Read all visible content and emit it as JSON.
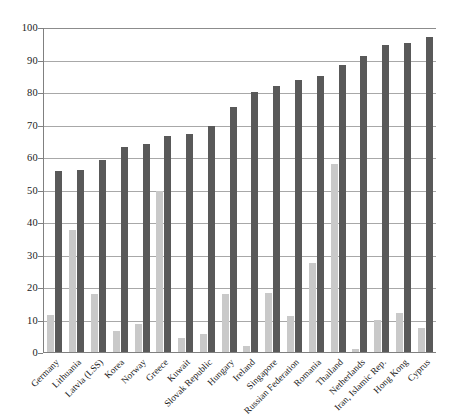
{
  "chart_data": {
    "type": "bar",
    "title": "",
    "subtitle": "",
    "xlabel": "",
    "ylabel": "",
    "ylim": [
      0,
      100
    ],
    "yticks": [
      0,
      10,
      20,
      30,
      40,
      50,
      60,
      70,
      80,
      90,
      100
    ],
    "grid": true,
    "legend_position": "none",
    "categories": [
      "Germany",
      "Lithuania",
      "Latvia (LSS)",
      "Korea",
      "Norway",
      "Greece",
      "Kuwait",
      "Slovak Republic",
      "Hungary",
      "Ireland",
      "Singapore",
      "Russian Federation",
      "Romania",
      "Thailand",
      "Netherlands",
      "Iran, Islamic Rep.",
      "Hong Kong",
      "Cyprus"
    ],
    "series": [
      {
        "name": "light-series",
        "color": "#c9c9c9",
        "values": [
          11.5,
          37.5,
          17.8,
          6.5,
          8.5,
          49.5,
          4.3,
          5.6,
          17.8,
          1.8,
          18.1,
          11.1,
          27.5,
          58.0,
          0.8,
          10.0,
          11.9,
          7.4
        ]
      },
      {
        "name": "dark-series",
        "color": "#595959",
        "values": [
          55.6,
          56.1,
          59.2,
          63.2,
          64.0,
          66.6,
          67.2,
          69.4,
          75.4,
          80.0,
          82.0,
          83.8,
          84.8,
          88.4,
          91.1,
          94.5,
          95.2,
          96.8
        ]
      }
    ]
  }
}
